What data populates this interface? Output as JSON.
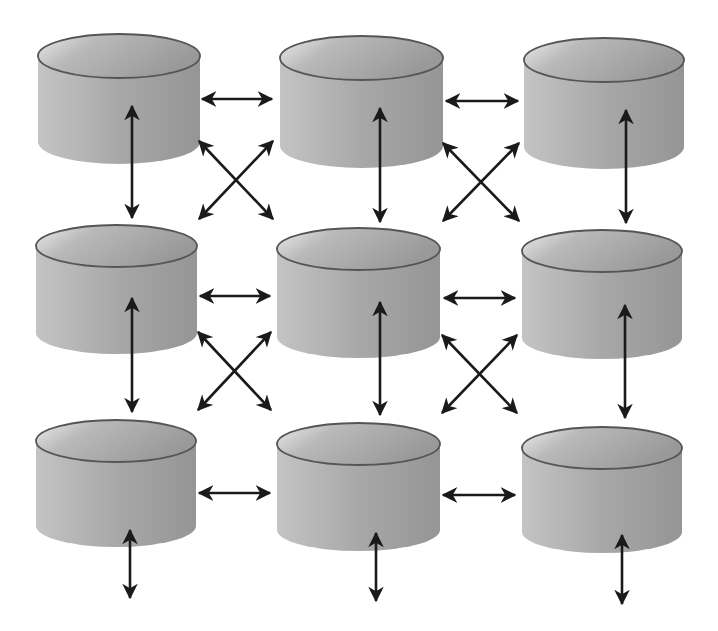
{
  "diagram": {
    "title": "",
    "type": "mesh-grid",
    "colors": {
      "background": "#ffffff",
      "cylinder_light": "#d8d8d8",
      "cylinder_dark": "#9a9a9a",
      "cylinder_outline": "#555555",
      "arrow": "#1a1a1a"
    },
    "nodes": [
      {
        "id": "r1c1",
        "x": 38,
        "y": 56,
        "w": 162,
        "ry": 22,
        "h": 86
      },
      {
        "id": "r1c2",
        "x": 280,
        "y": 58,
        "w": 163,
        "ry": 22,
        "h": 88
      },
      {
        "id": "r1c3",
        "x": 524,
        "y": 60,
        "w": 160,
        "ry": 22,
        "h": 87
      },
      {
        "id": "r2c1",
        "x": 36,
        "y": 246,
        "w": 161,
        "ry": 21,
        "h": 87
      },
      {
        "id": "r2c2",
        "x": 277,
        "y": 249,
        "w": 163,
        "ry": 21,
        "h": 88
      },
      {
        "id": "r2c3",
        "x": 522,
        "y": 251,
        "w": 160,
        "ry": 21,
        "h": 87
      },
      {
        "id": "r3c1",
        "x": 36,
        "y": 441,
        "w": 160,
        "ry": 21,
        "h": 85
      },
      {
        "id": "r3c2",
        "x": 277,
        "y": 444,
        "w": 163,
        "ry": 21,
        "h": 86
      },
      {
        "id": "r3c3",
        "x": 522,
        "y": 448,
        "w": 160,
        "ry": 21,
        "h": 84
      }
    ],
    "links": [
      {
        "kind": "horizontal",
        "x1": 202,
        "y1": 99,
        "x2": 272,
        "y2": 99
      },
      {
        "kind": "horizontal",
        "x1": 446,
        "y1": 101,
        "x2": 518,
        "y2": 101
      },
      {
        "kind": "horizontal",
        "x1": 200,
        "y1": 296,
        "x2": 270,
        "y2": 296
      },
      {
        "kind": "horizontal",
        "x1": 444,
        "y1": 298,
        "x2": 515,
        "y2": 298
      },
      {
        "kind": "horizontal",
        "x1": 199,
        "y1": 493,
        "x2": 270,
        "y2": 493
      },
      {
        "kind": "horizontal",
        "x1": 443,
        "y1": 495,
        "x2": 515,
        "y2": 495
      },
      {
        "kind": "vertical",
        "x1": 132,
        "y1": 106,
        "x2": 132,
        "y2": 218
      },
      {
        "kind": "vertical",
        "x1": 380,
        "y1": 108,
        "x2": 380,
        "y2": 222
      },
      {
        "kind": "vertical",
        "x1": 626,
        "y1": 110,
        "x2": 626,
        "y2": 223
      },
      {
        "kind": "vertical",
        "x1": 132,
        "y1": 298,
        "x2": 132,
        "y2": 412
      },
      {
        "kind": "vertical",
        "x1": 380,
        "y1": 302,
        "x2": 380,
        "y2": 415
      },
      {
        "kind": "vertical",
        "x1": 625,
        "y1": 305,
        "x2": 625,
        "y2": 418
      },
      {
        "kind": "vertical",
        "x1": 130,
        "y1": 530,
        "x2": 130,
        "y2": 598
      },
      {
        "kind": "vertical",
        "x1": 376,
        "y1": 533,
        "x2": 376,
        "y2": 601
      },
      {
        "kind": "vertical",
        "x1": 622,
        "y1": 535,
        "x2": 622,
        "y2": 604
      },
      {
        "kind": "diagonal",
        "x1": 199,
        "y1": 141,
        "x2": 273,
        "y2": 219
      },
      {
        "kind": "diagonal",
        "x1": 273,
        "y1": 141,
        "x2": 199,
        "y2": 219
      },
      {
        "kind": "diagonal",
        "x1": 443,
        "y1": 143,
        "x2": 519,
        "y2": 221
      },
      {
        "kind": "diagonal",
        "x1": 519,
        "y1": 143,
        "x2": 443,
        "y2": 221
      },
      {
        "kind": "diagonal",
        "x1": 198,
        "y1": 332,
        "x2": 271,
        "y2": 410
      },
      {
        "kind": "diagonal",
        "x1": 271,
        "y1": 332,
        "x2": 198,
        "y2": 410
      },
      {
        "kind": "diagonal",
        "x1": 442,
        "y1": 335,
        "x2": 517,
        "y2": 413
      },
      {
        "kind": "diagonal",
        "x1": 517,
        "y1": 335,
        "x2": 442,
        "y2": 413
      }
    ]
  }
}
